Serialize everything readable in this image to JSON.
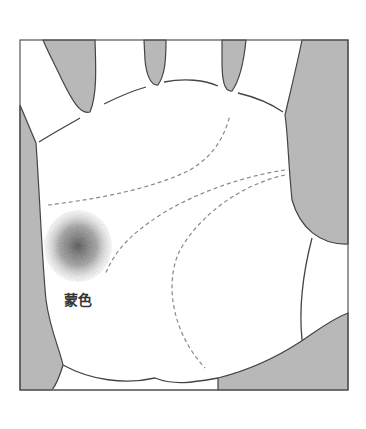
{
  "figure": {
    "label": "蒙色",
    "colors": {
      "background": "#ffffff",
      "shade": "#b8b8b8",
      "outline": "#444444",
      "dashed_line": "#888888",
      "spot": "#555555"
    }
  }
}
